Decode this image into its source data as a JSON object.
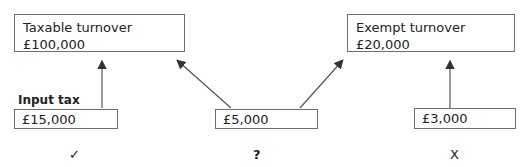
{
  "top_boxes": [
    {
      "title": "Taxable turnover",
      "value": "£100,000"
    },
    {
      "title": "Exempt turnover",
      "value": "£20,000"
    }
  ],
  "bottom_boxes": [
    {
      "label": "Input tax",
      "value": "£15,000",
      "mark": "✓"
    },
    {
      "label": "",
      "value": "£5,000",
      "mark": "?"
    },
    {
      "label": "",
      "value": "£3,000",
      "mark": "X"
    }
  ],
  "colors": {
    "border": "#6e6e6e",
    "arrow": "#333333"
  }
}
